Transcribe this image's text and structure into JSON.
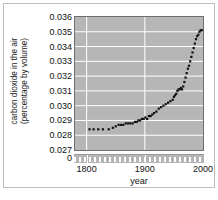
{
  "chart_data": {
    "type": "scatter",
    "title": "",
    "xlabel": "year",
    "ylabel": "carbon dioxide in the air (percentage by volume)",
    "ylabel_line1": "carbon dioxide in the air",
    "ylabel_line2": "(percentage by volume)",
    "xlim": [
      1780,
      2000
    ],
    "ylim": [
      0.027,
      0.036
    ],
    "yticks": [
      "0.036",
      "0.035",
      "0.034",
      "0.033",
      "0.032",
      "0.031",
      "0.030",
      "0.029",
      "0.028",
      "0.027"
    ],
    "ytick_values": [
      0.036,
      0.035,
      0.034,
      0.033,
      0.032,
      0.031,
      0.03,
      0.029,
      0.028,
      0.027
    ],
    "axis_break_label": "0",
    "xticks": [
      "1800",
      "1900",
      "2000"
    ],
    "xtick_values": [
      1800,
      1900,
      2000
    ],
    "grid": "horizontal-and-vertical",
    "legend": "none",
    "plot_background": "#b6b6b6",
    "gridline_color": "#ffffff",
    "marker_color": "#111111",
    "x": [
      1805,
      1812,
      1820,
      1828,
      1838,
      1845,
      1850,
      1855,
      1859,
      1863,
      1867,
      1871,
      1875,
      1879,
      1883,
      1886,
      1889,
      1892,
      1895,
      1898,
      1901,
      1904,
      1907,
      1910,
      1913,
      1916,
      1920,
      1924,
      1928,
      1932,
      1936,
      1940,
      1944,
      1948,
      1950,
      1952,
      1954,
      1956,
      1958,
      1960,
      1962,
      1964,
      1966,
      1968,
      1970,
      1972,
      1974,
      1976,
      1978,
      1980,
      1982,
      1984,
      1986,
      1988,
      1990,
      1992,
      1994,
      1996,
      1998
    ],
    "values": [
      0.0284,
      0.0284,
      0.0284,
      0.0284,
      0.0284,
      0.0285,
      0.0286,
      0.0287,
      0.0287,
      0.0287,
      0.0288,
      0.0288,
      0.0288,
      0.0288,
      0.0289,
      0.0289,
      0.029,
      0.029,
      0.0291,
      0.0291,
      0.0292,
      0.0291,
      0.0293,
      0.0293,
      0.0294,
      0.0295,
      0.0296,
      0.0298,
      0.0299,
      0.03,
      0.0301,
      0.0302,
      0.0303,
      0.0304,
      0.0306,
      0.0307,
      0.0308,
      0.031,
      0.0311,
      0.0311,
      0.0312,
      0.0311,
      0.0313,
      0.0316,
      0.0319,
      0.0322,
      0.0325,
      0.0327,
      0.033,
      0.0333,
      0.0336,
      0.0339,
      0.0342,
      0.0345,
      0.0347,
      0.0348,
      0.035,
      0.0351,
      0.0351
    ]
  }
}
